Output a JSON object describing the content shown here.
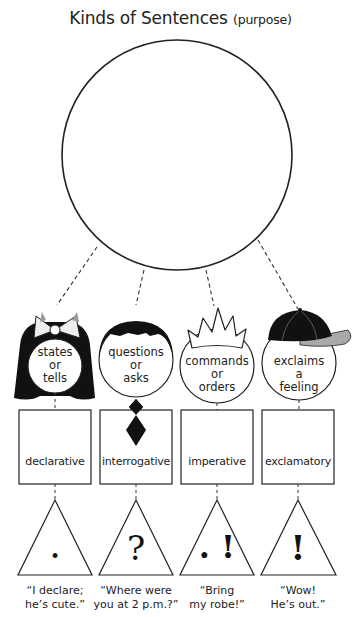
{
  "title": {
    "main": "Kinds of Sentences",
    "sub": "(purpose)"
  },
  "central_circle": {
    "label": ""
  },
  "kinds": [
    {
      "id": "declarative",
      "character": "girl-with-bow",
      "purpose": [
        "states",
        "or",
        "tells"
      ],
      "name": "declarative",
      "punctuation": ".",
      "punctuation_icon": "period-icon",
      "example": [
        "“I declare;",
        "he’s cute.”"
      ]
    },
    {
      "id": "interrogative",
      "character": "boy-with-tie",
      "purpose": [
        "questions",
        "or",
        "asks"
      ],
      "name": "interrogative",
      "punctuation": "?",
      "punctuation_icon": "question-mark-icon",
      "example": [
        "“Where were",
        "you at 2 p.m.?”"
      ]
    },
    {
      "id": "imperative",
      "character": "king-with-crown",
      "purpose": [
        "commands",
        "or",
        "orders"
      ],
      "name": "imperative",
      "punctuation": ". !",
      "punctuation_icon": "period-or-exclamation-icon",
      "example": [
        "“Bring",
        "my robe!”"
      ]
    },
    {
      "id": "exclamatory",
      "character": "kid-with-cap",
      "purpose": [
        "exclaims",
        "a",
        "feeling"
      ],
      "name": "exclamatory",
      "punctuation": "!",
      "punctuation_icon": "exclamation-mark-icon",
      "example": [
        "“Wow!",
        "He’s out.”"
      ]
    }
  ],
  "colors": {
    "line": "#222222",
    "hair": "#111111",
    "cap_brim": "#a9a9a9",
    "background": "#ffffff"
  }
}
